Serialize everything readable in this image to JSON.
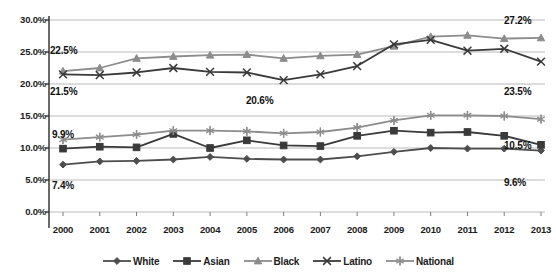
{
  "chart_data": {
    "type": "line",
    "title": "",
    "xlabel": "",
    "ylabel": "",
    "x": [
      "2000",
      "2001",
      "2002",
      "2003",
      "2004",
      "2005",
      "2006",
      "2007",
      "2008",
      "2009",
      "2010",
      "2011",
      "2012",
      "2013"
    ],
    "categories": [
      "2000",
      "2001",
      "2002",
      "2003",
      "2004",
      "2005",
      "2006",
      "2007",
      "2008",
      "2009",
      "2010",
      "2011",
      "2012",
      "2013"
    ],
    "ylim": [
      0,
      30
    ],
    "ytick_labels": [
      "0.0%",
      "5.0%",
      "10.0%",
      "15.0%",
      "20.0%",
      "25.0%",
      "30.0%"
    ],
    "ytick_values": [
      0,
      5,
      10,
      15,
      20,
      25,
      30
    ],
    "grid": true,
    "legend_position": "bottom",
    "series": [
      {
        "name": "White",
        "marker": "diamond",
        "color": "#4d4d4d",
        "values": [
          7.4,
          7.9,
          8.0,
          8.2,
          8.6,
          8.3,
          8.2,
          8.2,
          8.7,
          9.4,
          10.0,
          9.9,
          9.9,
          9.6
        ]
      },
      {
        "name": "Asian",
        "marker": "square",
        "color": "#3a3a3a",
        "values": [
          9.9,
          10.2,
          10.1,
          12.2,
          10.0,
          11.2,
          10.4,
          10.3,
          11.9,
          12.7,
          12.4,
          12.5,
          11.9,
          10.5
        ]
      },
      {
        "name": "Black",
        "marker": "triangle",
        "color": "#8c8c8c",
        "values": [
          22.0,
          22.5,
          24.0,
          24.3,
          24.5,
          24.6,
          24.0,
          24.4,
          24.6,
          25.9,
          27.4,
          27.6,
          27.1,
          27.2
        ]
      },
      {
        "name": "Latino",
        "marker": "x",
        "color": "#3a3a3a",
        "values": [
          21.5,
          21.4,
          21.8,
          22.5,
          21.9,
          21.8,
          20.6,
          21.5,
          22.8,
          26.2,
          26.9,
          25.2,
          25.5,
          23.5
        ]
      },
      {
        "name": "National",
        "marker": "asterisk",
        "color": "#8c8c8c",
        "values": [
          11.3,
          11.7,
          12.1,
          12.7,
          12.7,
          12.6,
          12.3,
          12.5,
          13.2,
          14.3,
          15.1,
          15.1,
          15.0,
          14.5
        ]
      }
    ],
    "annotations": [
      {
        "id": "black-2000",
        "text": "22.5%",
        "x": 50,
        "y": 45,
        "align": "left"
      },
      {
        "id": "black-2013",
        "text": "27.2%",
        "x": 504,
        "y": 15,
        "align": "left"
      },
      {
        "id": "latino-2000",
        "text": "21.5%",
        "x": 50,
        "y": 86,
        "align": "left"
      },
      {
        "id": "latino-2006",
        "text": "20.6%",
        "x": 246,
        "y": 95,
        "align": "left"
      },
      {
        "id": "latino-2013",
        "text": "23.5%",
        "x": 504,
        "y": 86,
        "align": "left"
      },
      {
        "id": "asian-2000",
        "text": "9.9%",
        "x": 52,
        "y": 129,
        "align": "left"
      },
      {
        "id": "national-2013",
        "text": "10.5%",
        "x": 504,
        "y": 140,
        "align": "left"
      },
      {
        "id": "white-2000",
        "text": "7.4%",
        "x": 52,
        "y": 180,
        "align": "left"
      },
      {
        "id": "white-2013",
        "text": "9.6%",
        "x": 504,
        "y": 177,
        "align": "left"
      }
    ]
  },
  "axis": {
    "ytick_labels": [
      "30.0%",
      "25.0%",
      "20.0%",
      "15.0%",
      "10.0%",
      "5.0%",
      "0.0%"
    ],
    "xtick_labels": [
      "2000",
      "2001",
      "2002",
      "2003",
      "2004",
      "2005",
      "2006",
      "2007",
      "2008",
      "2009",
      "2010",
      "2011",
      "2012",
      "2013"
    ]
  },
  "legend": {
    "items": [
      {
        "label": "White",
        "marker": "diamond",
        "color": "#4d4d4d"
      },
      {
        "label": "Asian",
        "marker": "square",
        "color": "#3a3a3a"
      },
      {
        "label": "Black",
        "marker": "triangle",
        "color": "#8c8c8c"
      },
      {
        "label": "Latino",
        "marker": "x",
        "color": "#3a3a3a"
      },
      {
        "label": "National",
        "marker": "asterisk",
        "color": "#8c8c8c"
      }
    ]
  }
}
